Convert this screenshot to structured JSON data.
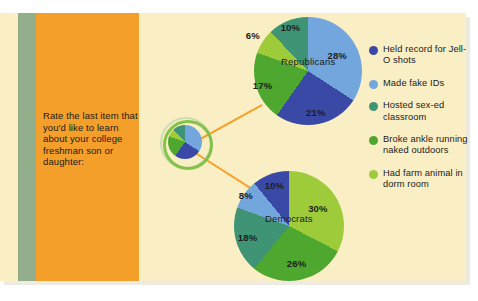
{
  "question": {
    "text": "Rate the last item that you'd like to learn about your college freshman son or daughter:"
  },
  "colors": {
    "background": "#faeec4",
    "panel_orange": "#f49f2a",
    "sage": "#93ae8b",
    "connector": "#f5a22b",
    "series": [
      "#3b49a6",
      "#73a6dd",
      "#3f9476",
      "#4ea72e",
      "#9ecb3a"
    ]
  },
  "legend": {
    "position": "right",
    "items": [
      {
        "label": "Held record for Jell-O shots",
        "color": "#3b49a6",
        "dot": "legend-dot-icon"
      },
      {
        "label": "Made fake IDs",
        "color": "#73a6dd",
        "dot": "legend-dot-icon"
      },
      {
        "label": "Hosted sex-ed classroom",
        "color": "#3f9476",
        "dot": "legend-dot-icon"
      },
      {
        "label": "Broke ankle running naked outdoors",
        "color": "#4ea72e",
        "dot": "legend-dot-icon"
      },
      {
        "label": "Had farm animal in dorm room",
        "color": "#9ecb3a",
        "dot": "legend-dot-icon"
      }
    ]
  },
  "chart_data": [
    {
      "type": "pie",
      "title": "Republicans",
      "categories": [
        "Made fake IDs",
        "Held record for Jell-O shots",
        "Broke ankle running naked outdoors",
        "Had farm animal in dorm room",
        "Hosted sex-ed classroom"
      ],
      "values": [
        28,
        21,
        17,
        6,
        10
      ],
      "labels": [
        "28%",
        "21%",
        "17%",
        "6%",
        "10%"
      ],
      "colors": [
        "#73a6dd",
        "#3b49a6",
        "#4ea72e",
        "#9ecb3a",
        "#3f9476"
      ],
      "xlabel": "",
      "ylabel": ""
    },
    {
      "type": "pie",
      "title": "Democrats",
      "categories": [
        "Had farm animal in dorm room",
        "Broke ankle running naked outdoors",
        "Hosted sex-ed classroom",
        "Made fake IDs",
        "Held record for Jell-O shots"
      ],
      "values": [
        30,
        26,
        18,
        8,
        10
      ],
      "labels": [
        "30%",
        "26%",
        "18%",
        "8%",
        "10%"
      ],
      "colors": [
        "#9ecb3a",
        "#4ea72e",
        "#3f9476",
        "#73a6dd",
        "#3b49a6"
      ],
      "xlabel": "",
      "ylabel": ""
    }
  ],
  "mini_chart": {
    "type": "pie",
    "name": "source-pie-thumbnail",
    "values": [
      28,
      21,
      17,
      6,
      10
    ],
    "colors": [
      "#73a6dd",
      "#3b49a6",
      "#4ea72e",
      "#9ecb3a",
      "#3f9476"
    ]
  }
}
